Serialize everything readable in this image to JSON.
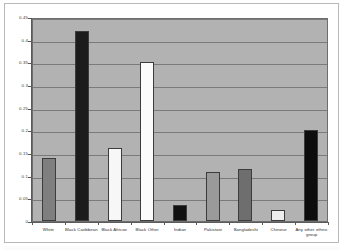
{
  "chart_data": {
    "type": "bar",
    "title": "",
    "subtitle": "",
    "xlabel": "",
    "ylabel": "",
    "categories": [
      "White",
      "Black Caribbean",
      "Black African",
      "Black Other",
      "Indian",
      "Pakistani",
      "Bangladeshi",
      "Chinese",
      "Any other ethnic group"
    ],
    "values": [
      0.14,
      0.42,
      0.16,
      0.35,
      0.035,
      0.108,
      0.115,
      0.025,
      0.2
    ],
    "bar_colors": [
      "#7f7f7f",
      "#1c1c1c",
      "#f7f7f7",
      "#fbfbfb",
      "#111111",
      "#9a9a9a",
      "#6e6e6e",
      "#eeeeee",
      "#0d0d0d"
    ],
    "ylim": [
      0,
      0.45
    ],
    "ytick_values": [
      0,
      0.05,
      0.1,
      0.15,
      0.2,
      0.25,
      0.3,
      0.35,
      0.4,
      0.45
    ],
    "ytick_labels": [
      "0",
      "0.05",
      "0.1",
      "0.15",
      "0.2",
      "0.25",
      "0.3",
      "0.35",
      "0.4",
      "0.45"
    ],
    "grid": true,
    "grid_axis": "y",
    "legend": false,
    "legend_position": "none",
    "plot_background": "#b2b2b2",
    "figure_background": "#ffffff",
    "gridline_color": "#7a7a7a",
    "axis_color": "#5a5a5a",
    "bar_border_color": "#3c3c3c"
  }
}
